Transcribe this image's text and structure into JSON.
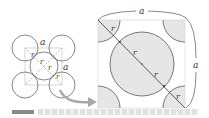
{
  "figure": {
    "left_diagram": {
      "description": "Unit cell with corner spheres and center sphere",
      "labels": {
        "a_top": "a",
        "a_right": "a",
        "r1": "r",
        "r2": "r",
        "r3": "r",
        "r4": "r"
      }
    },
    "right_diagram": {
      "description": "Diagonal cross-section of body-centered cubic cell",
      "labels": {
        "a_top": "a",
        "a_right": "a",
        "r1": "r",
        "r2": "r",
        "r3": "r",
        "r4": "r"
      }
    },
    "colors": {
      "fill": "#e6e6e6",
      "stroke": "#444444",
      "arrow": "#a8a8a8",
      "dashed": "#888888"
    }
  }
}
